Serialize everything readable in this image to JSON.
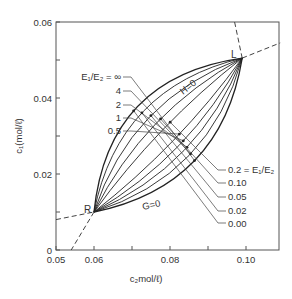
{
  "chart_data": {
    "type": "line",
    "title": "",
    "xlabel": "c2 mol/ℓ",
    "ylabel": "c1 (mol/ℓ)",
    "xlim": [
      0.05,
      0.109
    ],
    "ylim": [
      0,
      0.06
    ],
    "grid": false,
    "x_ticks": [
      {
        "value": 0.05,
        "label": "0.05"
      },
      {
        "value": 0.06,
        "label": "0.06"
      },
      {
        "value": 0.07,
        "label": ""
      },
      {
        "value": 0.08,
        "label": "0.08"
      },
      {
        "value": 0.09,
        "label": ""
      },
      {
        "value": 0.1,
        "label": "0.10"
      }
    ],
    "y_ticks": [
      {
        "value": 0,
        "label": "0"
      },
      {
        "value": 0.01,
        "label": ""
      },
      {
        "value": 0.02,
        "label": "0.02"
      },
      {
        "value": 0.03,
        "label": ""
      },
      {
        "value": 0.04,
        "label": "0.04"
      },
      {
        "value": 0.05,
        "label": ""
      },
      {
        "value": 0.06,
        "label": "0.06"
      }
    ],
    "points": {
      "R": {
        "label": "R",
        "c2": 0.06,
        "c1": 0.01
      },
      "L": {
        "label": "L",
        "c2": 0.099,
        "c1": 0.0505
      }
    },
    "boundary_labels": {
      "upper": "H = 0",
      "lower": "G = 0"
    },
    "series": [
      {
        "name": "E1/E2 = ∞",
        "param": "∞",
        "bow": -0.0088
      },
      {
        "name": "E1/E2 = 4",
        "param": "4",
        "bow": -0.007
      },
      {
        "name": "E1/E2 = 2",
        "param": "2",
        "bow": -0.0053
      },
      {
        "name": "E1/E2 = 1",
        "param": "1",
        "bow": -0.0036
      },
      {
        "name": "E1/E2 = 0.5",
        "param": "0.5",
        "bow": -0.0018
      },
      {
        "name": "E1/E2 = 0.2",
        "param": "0.2",
        "bow": 0.0018
      },
      {
        "name": "E1/E2 = 0.10",
        "param": "0.10",
        "bow": 0.004
      },
      {
        "name": "E1/E2 = 0.05",
        "param": "0.05",
        "bow": 0.0062
      },
      {
        "name": "E1/E2 = 0.02",
        "param": "0.02",
        "bow": 0.0082
      },
      {
        "name": "E1/E2 = 0.00",
        "param": "0.00",
        "bow": 0.01
      }
    ],
    "extra_curves_between": 4,
    "left_labels": [
      {
        "text": "E₁/E₂ = ∞",
        "series": 0
      },
      {
        "text": "4",
        "series": 1
      },
      {
        "text": "2",
        "series": 2
      },
      {
        "text": "1",
        "series": 3
      },
      {
        "text": "0.5",
        "series": 4
      }
    ],
    "right_labels": [
      {
        "text": "0.2 = E₁/E₂",
        "series": 5
      },
      {
        "text": "0.10",
        "series": 6
      },
      {
        "text": "0.05",
        "series": 7
      },
      {
        "text": "0.02",
        "series": 8
      },
      {
        "text": "0.00",
        "series": 9
      }
    ],
    "dashed_curves": [
      {
        "name": "through-L-upper",
        "from": [
          0.097,
          0.06
        ],
        "to": [
          0.099,
          0.0505
        ]
      },
      {
        "name": "through-L-right",
        "from": [
          0.099,
          0.0505
        ],
        "to": [
          0.109,
          0.0545
        ]
      },
      {
        "name": "through-R-left",
        "from": [
          0.05,
          0.008
        ],
        "to": [
          0.06,
          0.01
        ]
      },
      {
        "name": "through-R-down",
        "from": [
          0.06,
          0.01
        ],
        "to": [
          0.054,
          0.0
        ]
      }
    ]
  },
  "labels": {
    "x_axis_title": "c₂mol/ℓ)",
    "y_axis_title": "c₁(mol/ℓ)",
    "H0": "H=0",
    "G0": "G=0",
    "R": "R",
    "L": "L",
    "left": [
      "E₁/E₂ = ∞",
      "4",
      "2",
      "1",
      "0.5"
    ],
    "right": [
      "0.2 = E₁/E₂",
      "0.10",
      "0.05",
      "0.02",
      "0.00"
    ]
  }
}
